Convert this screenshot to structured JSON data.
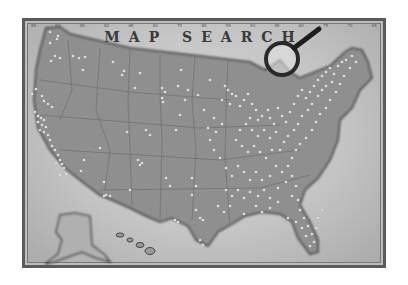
{
  "title": "MAP SEARCH",
  "longitude_ticks": [
    "85",
    "80",
    "85",
    "80",
    "85",
    "80",
    "75",
    "80",
    "95",
    "90",
    "85",
    "80",
    "75",
    "70",
    "65"
  ],
  "colors": {
    "paper": "#c8c8c8",
    "land": "#8f8f8f",
    "land_dark": "#666666",
    "border": "#5a5a5a",
    "pin": "#f4f4f4"
  },
  "icons": {
    "magnifier": "magnifying-glass-icon"
  }
}
